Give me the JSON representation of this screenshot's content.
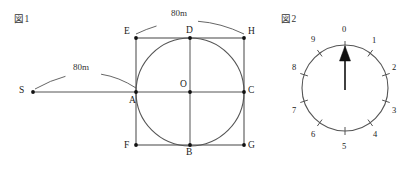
{
  "page": {
    "background": "#ffffff",
    "stroke_color": "#555555",
    "text_color": "#1a1a1a",
    "width": 410,
    "height": 171
  },
  "figure1": {
    "caption": "図1",
    "caption_pos": {
      "x": 14,
      "y": 11
    },
    "square": {
      "left": 136,
      "top": 38,
      "right": 244,
      "bottom": 145,
      "corners": [
        {
          "name": "E",
          "label": "E",
          "x": 136,
          "y": 38,
          "lx": 124,
          "ly": 26
        },
        {
          "name": "H",
          "label": "H",
          "x": 244,
          "y": 38,
          "lx": 248,
          "ly": 26
        },
        {
          "name": "F",
          "label": "F",
          "x": 136,
          "y": 145,
          "lx": 124,
          "ly": 140
        },
        {
          "name": "G",
          "label": "G",
          "x": 244,
          "y": 145,
          "lx": 248,
          "ly": 140
        }
      ]
    },
    "circle": {
      "cx": 190,
      "cy": 92,
      "r": 54
    },
    "points": [
      {
        "name": "A",
        "label": "A",
        "x": 136,
        "y": 92,
        "lx": 129,
        "ly": 95
      },
      {
        "name": "C",
        "label": "C",
        "x": 244,
        "y": 92,
        "lx": 248,
        "ly": 85
      },
      {
        "name": "D",
        "label": "D",
        "x": 190,
        "y": 38,
        "lx": 186,
        "ly": 25
      },
      {
        "name": "B",
        "label": "B",
        "x": 190,
        "y": 145,
        "lx": 186,
        "ly": 147
      },
      {
        "name": "O",
        "label": "O",
        "x": 190,
        "y": 92,
        "lx": 180,
        "ly": 79
      },
      {
        "name": "S",
        "label": "S",
        "x": 33,
        "y": 92,
        "lx": 19,
        "ly": 85
      }
    ],
    "baseline": {
      "x1": 33,
      "y1": 92,
      "x2": 244,
      "y2": 92
    },
    "arcs": [
      {
        "name": "top-arc",
        "label": "80m",
        "path": "M 136 34 Q 190 8 244 34",
        "label_x": 171,
        "label_y": 8,
        "gap_from": 158,
        "gap_to": 200
      },
      {
        "name": "left-arc",
        "label": "80m",
        "path": "M 35 89 Q 90 58 136 88",
        "label_x": 73,
        "label_y": 62,
        "gap_from": 68,
        "gap_to": 104
      }
    ]
  },
  "figure2": {
    "caption": "図2",
    "caption_pos": {
      "x": 281,
      "y": 11
    },
    "dial": {
      "cx": 345,
      "cy": 88,
      "r": 43,
      "tick_outer": 47,
      "tick_inner": 39,
      "ticks": 10,
      "start_angle_deg": -90,
      "step_deg": 36
    },
    "needle": {
      "from_x": 345,
      "from_y": 90,
      "to_x": 345,
      "to_y": 46,
      "head_width": 11,
      "head_length": 15,
      "color": "#111111"
    },
    "numbers": [
      {
        "value": "0",
        "angle": -90,
        "lx": 342,
        "ly": 24
      },
      {
        "value": "1",
        "angle": -54,
        "lx": 372,
        "ly": 35
      },
      {
        "value": "2",
        "angle": -18,
        "lx": 392,
        "ly": 62
      },
      {
        "value": "3",
        "angle": 18,
        "lx": 392,
        "ly": 105
      },
      {
        "value": "4",
        "angle": 54,
        "lx": 373,
        "ly": 129
      },
      {
        "value": "5",
        "angle": 90,
        "lx": 342,
        "ly": 141
      },
      {
        "value": "6",
        "angle": 126,
        "lx": 311,
        "ly": 129
      },
      {
        "value": "7",
        "angle": 162,
        "lx": 292,
        "ly": 105
      },
      {
        "value": "8",
        "angle": 198,
        "lx": 292,
        "ly": 62
      },
      {
        "value": "9",
        "angle": 234,
        "lx": 311,
        "ly": 34
      }
    ]
  }
}
